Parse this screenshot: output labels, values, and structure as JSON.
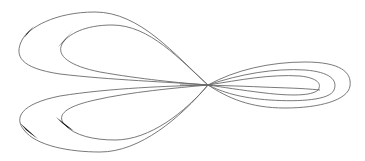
{
  "diagram": {
    "type": "curve-loops",
    "colors": {
      "background": "#ffffff",
      "line": "#6a6a6a",
      "arrow": "#111111"
    },
    "crossing_point": [
      208,
      85
    ],
    "curves": [
      {
        "name": "top-outer-loop",
        "d": "M208,85 C175,55 140,12 95,12 C55,12 28,28 22,40 C14,56 20,68 60,74 C110,80 170,82 208,85"
      },
      {
        "name": "top-inner-loop",
        "d": "M208,85 C180,60 150,25 112,25 C85,25 68,34 62,44 C56,56 70,66 100,72 C140,79 180,83 208,85"
      },
      {
        "name": "bottom-outer-loop",
        "d": "M208,85 C170,86 110,88 60,96 C20,104 14,118 24,130 C36,146 70,152 100,152 C140,152 180,118 208,85"
      },
      {
        "name": "bottom-inner-loop",
        "d": "M208,85 C175,88 130,92 95,100 C68,106 56,114 64,124 C74,136 95,140 115,140 C150,140 185,112 208,85"
      },
      {
        "name": "right-outer-loop",
        "d": "M208,85 C235,70 270,62 305,62 C340,62 352,72 350,86 C348,100 320,108 285,108 C250,108 228,98 208,85"
      },
      {
        "name": "right-middle-loop",
        "d": "M208,85 C240,74 275,68 305,70 C330,72 338,80 334,90 C330,100 300,102 270,100 C240,98 222,92 208,85"
      },
      {
        "name": "right-inner-loop",
        "d": "M208,85 C240,80 270,74 300,76 C318,78 322,84 318,90 C312,96 290,96 265,93 C240,90 222,87 208,85"
      },
      {
        "name": "right-straight-strand",
        "d": "M180,85 C210,85 240,86 262,87 C285,88 300,88 320,90"
      }
    ],
    "arrowheads": [
      {
        "name": "top-outer-arrowhead",
        "points": "M34,26 L19,44 L24,38 L27,33 Z"
      },
      {
        "name": "top-inner-arrowhead",
        "points": "M74,29 L58,47 L64,41 L68,36 Z"
      },
      {
        "name": "bottom-outer-arrowhead",
        "points": "M20,123 L38,139 L31,134 L26,130 Z"
      },
      {
        "name": "bottom-inner-arrowhead",
        "points": "M56,117 L74,131 L67,127 L62,123 Z"
      }
    ]
  }
}
